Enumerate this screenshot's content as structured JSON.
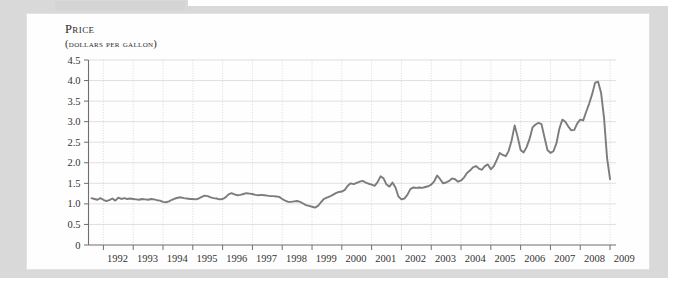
{
  "figure": {
    "title": "Price",
    "subtitle": "(dollars per gallon)"
  },
  "chart_data": {
    "type": "line",
    "title": "Price",
    "subtitle": "(dollars per gallon)",
    "xlabel": "",
    "ylabel": "Price (dollars per gallon)",
    "xlim": [
      1991.5,
      2009.2
    ],
    "ylim": [
      0,
      4.5
    ],
    "grid": true,
    "legend": false,
    "legend_position": "none",
    "line_color": "#7c7c7c",
    "ytick_labels": [
      "0",
      "0.5",
      "1.0",
      "1.5",
      "2.0",
      "2.5",
      "3.0",
      "3.5",
      "4.0",
      "4.5"
    ],
    "ytick_values": [
      0,
      0.5,
      1.0,
      1.5,
      2.0,
      2.5,
      3.0,
      3.5,
      4.0,
      4.5
    ],
    "xtick_labels": [
      "1992",
      "1993",
      "1994",
      "1995",
      "1996",
      "1997",
      "1998",
      "1999",
      "2000",
      "2001",
      "2002",
      "2003",
      "2004",
      "2005",
      "2006",
      "2007",
      "2008",
      "2009"
    ],
    "xtick_values": [
      1992,
      1993,
      1994,
      1995,
      1996,
      1997,
      1998,
      1999,
      2000,
      2001,
      2002,
      2003,
      2004,
      2005,
      2006,
      2007,
      2008,
      2009
    ],
    "series": [
      {
        "name": "Retail gasoline price",
        "x": [
          1991.6,
          1991.7,
          1991.8,
          1991.9,
          1992.0,
          1992.1,
          1992.2,
          1992.3,
          1992.4,
          1992.5,
          1992.6,
          1992.7,
          1992.8,
          1992.9,
          1993.0,
          1993.1,
          1993.2,
          1993.3,
          1993.4,
          1993.5,
          1993.6,
          1993.7,
          1993.8,
          1993.9,
          1994.0,
          1994.1,
          1994.2,
          1994.3,
          1994.4,
          1994.5,
          1994.6,
          1994.7,
          1994.8,
          1994.9,
          1995.0,
          1995.1,
          1995.2,
          1995.3,
          1995.4,
          1995.5,
          1995.6,
          1995.7,
          1995.8,
          1995.9,
          1996.0,
          1996.1,
          1996.2,
          1996.3,
          1996.4,
          1996.5,
          1996.6,
          1996.7,
          1996.8,
          1996.9,
          1997.0,
          1997.1,
          1997.2,
          1997.3,
          1997.4,
          1997.5,
          1997.6,
          1997.7,
          1997.8,
          1997.9,
          1998.0,
          1998.1,
          1998.2,
          1998.3,
          1998.4,
          1998.5,
          1998.6,
          1998.7,
          1998.8,
          1998.9,
          1999.0,
          1999.1,
          1999.2,
          1999.3,
          1999.4,
          1999.5,
          1999.6,
          1999.7,
          1999.8,
          1999.9,
          2000.0,
          2000.1,
          2000.2,
          2000.3,
          2000.4,
          2000.5,
          2000.6,
          2000.7,
          2000.8,
          2000.9,
          2001.0,
          2001.1,
          2001.2,
          2001.3,
          2001.4,
          2001.5,
          2001.6,
          2001.7,
          2001.8,
          2001.9,
          2002.0,
          2002.1,
          2002.2,
          2002.3,
          2002.4,
          2002.5,
          2002.6,
          2002.7,
          2002.8,
          2002.9,
          2003.0,
          2003.1,
          2003.2,
          2003.3,
          2003.4,
          2003.5,
          2003.6,
          2003.7,
          2003.8,
          2003.9,
          2004.0,
          2004.1,
          2004.2,
          2004.3,
          2004.4,
          2004.5,
          2004.6,
          2004.7,
          2004.8,
          2004.9,
          2005.0,
          2005.1,
          2005.2,
          2005.3,
          2005.4,
          2005.5,
          2005.6,
          2005.7,
          2005.8,
          2005.9,
          2006.0,
          2006.1,
          2006.2,
          2006.3,
          2006.4,
          2006.5,
          2006.6,
          2006.7,
          2006.8,
          2006.9,
          2007.0,
          2007.1,
          2007.2,
          2007.3,
          2007.4,
          2007.5,
          2007.6,
          2007.7,
          2007.8,
          2007.9,
          2008.0,
          2008.1,
          2008.2,
          2008.3,
          2008.4,
          2008.5,
          2008.6,
          2008.7,
          2008.8,
          2008.9,
          2009.0
        ],
        "y": [
          1.14,
          1.12,
          1.1,
          1.14,
          1.1,
          1.07,
          1.09,
          1.13,
          1.08,
          1.15,
          1.12,
          1.14,
          1.12,
          1.13,
          1.12,
          1.11,
          1.1,
          1.12,
          1.11,
          1.1,
          1.12,
          1.11,
          1.09,
          1.08,
          1.05,
          1.04,
          1.06,
          1.1,
          1.13,
          1.15,
          1.16,
          1.14,
          1.13,
          1.12,
          1.12,
          1.11,
          1.13,
          1.17,
          1.2,
          1.19,
          1.16,
          1.14,
          1.13,
          1.11,
          1.12,
          1.16,
          1.23,
          1.26,
          1.23,
          1.21,
          1.22,
          1.24,
          1.26,
          1.25,
          1.24,
          1.22,
          1.21,
          1.22,
          1.21,
          1.2,
          1.19,
          1.19,
          1.18,
          1.17,
          1.12,
          1.08,
          1.05,
          1.05,
          1.06,
          1.07,
          1.05,
          1.01,
          0.97,
          0.95,
          0.93,
          0.91,
          0.95,
          1.04,
          1.12,
          1.15,
          1.18,
          1.22,
          1.26,
          1.29,
          1.3,
          1.34,
          1.44,
          1.5,
          1.48,
          1.51,
          1.54,
          1.56,
          1.52,
          1.49,
          1.47,
          1.44,
          1.53,
          1.67,
          1.62,
          1.47,
          1.42,
          1.52,
          1.4,
          1.18,
          1.11,
          1.13,
          1.22,
          1.36,
          1.4,
          1.39,
          1.4,
          1.39,
          1.41,
          1.43,
          1.47,
          1.55,
          1.69,
          1.6,
          1.5,
          1.52,
          1.56,
          1.62,
          1.6,
          1.54,
          1.57,
          1.64,
          1.75,
          1.81,
          1.89,
          1.92,
          1.86,
          1.83,
          1.92,
          1.96,
          1.84,
          1.92,
          2.07,
          2.24,
          2.19,
          2.16,
          2.29,
          2.55,
          2.91,
          2.63,
          2.31,
          2.25,
          2.38,
          2.58,
          2.86,
          2.93,
          2.97,
          2.94,
          2.62,
          2.31,
          2.24,
          2.28,
          2.47,
          2.83,
          3.05,
          3.0,
          2.88,
          2.79,
          2.8,
          2.96,
          3.05,
          3.03,
          3.24,
          3.44,
          3.67,
          3.95,
          3.97,
          3.7,
          3.08,
          2.12,
          1.6
        ]
      }
    ]
  }
}
